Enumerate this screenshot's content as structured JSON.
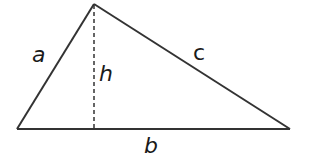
{
  "diagram": {
    "type": "triangle",
    "stroke_color": "#333333",
    "vertices": {
      "apex": [
        94,
        4
      ],
      "left": [
        17,
        129
      ],
      "right": [
        290,
        129
      ]
    },
    "altitude": {
      "from": [
        94,
        4
      ],
      "to": [
        94,
        129
      ],
      "style": "dashed"
    },
    "labels": {
      "a": "a",
      "b": "b",
      "c": "c",
      "h": "h"
    }
  }
}
